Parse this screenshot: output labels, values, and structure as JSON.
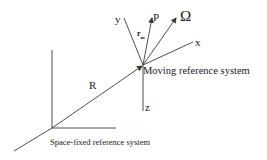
{
  "diagram": {
    "type": "reference-frames",
    "colors": {
      "line": "#3a3a3a",
      "text": "#1a1a1a",
      "background": "#ffffff"
    },
    "labels": {
      "y_axis": "y",
      "x_axis": "x",
      "z_axis": "z",
      "point": "P",
      "omega": "Ω",
      "position_vector": "r",
      "position_vector_subscript": "m",
      "translation_vector": "R",
      "moving_frame": "Moving reference system",
      "fixed_frame": "Space-fixed reference system"
    }
  }
}
